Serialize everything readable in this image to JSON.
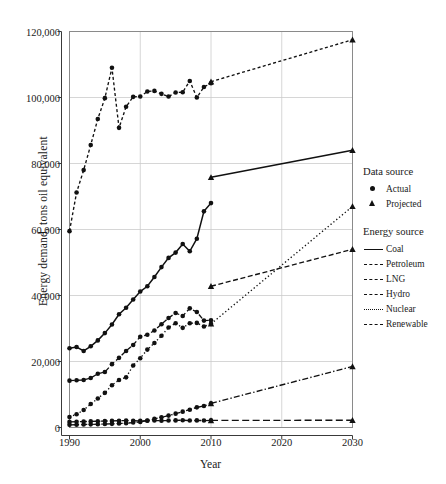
{
  "chart_data": {
    "type": "line",
    "title": "",
    "xlabel": "Year",
    "ylabel": "Energy demand, tons oil equivalent",
    "xlim": [
      1990,
      2030
    ],
    "ylim": [
      0,
      120000
    ],
    "xticks": [
      1990,
      2000,
      2010,
      2020,
      2030
    ],
    "xticklabels": [
      "1990",
      "2000",
      "2010",
      "2020",
      "2030"
    ],
    "yticks": [
      0,
      20000,
      40000,
      60000,
      80000,
      100000,
      120000
    ],
    "yticklabels": [
      "0",
      "20,000",
      "40,000",
      "60,000",
      "80,000",
      "100,000",
      "120,000"
    ],
    "grid": true,
    "legend_position": "right",
    "marker_actual": "circle",
    "marker_projected": "triangle",
    "line_color": "#111111",
    "grid_color": "#cccccc",
    "series": [
      {
        "name": "Coal",
        "style": "solid",
        "actual": {
          "x": [
            1990,
            1991,
            1992,
            1993,
            1994,
            1995,
            1996,
            1997,
            1998,
            1999,
            2000,
            2001,
            2002,
            2003,
            2004,
            2005,
            2006,
            2007,
            2008,
            2009,
            2010
          ],
          "y": [
            24000,
            24400,
            23200,
            24600,
            26400,
            28600,
            31200,
            34300,
            36300,
            38800,
            41200,
            42800,
            45600,
            48600,
            51400,
            53000,
            55600,
            53400,
            57200,
            65500,
            68000
          ]
        },
        "projected": {
          "x": [
            2010,
            2030
          ],
          "y": [
            75800,
            84000
          ]
        }
      },
      {
        "name": "Petroleum",
        "style": "dashed",
        "actual": {
          "x": [
            1990,
            1991,
            1992,
            1993,
            1994,
            1995,
            1996,
            1997,
            1998,
            1999,
            2000,
            2001,
            2002,
            2003,
            2004,
            2005,
            2006,
            2007,
            2008,
            2009,
            2010
          ],
          "y": [
            59500,
            71200,
            78000,
            85600,
            93500,
            99800,
            109000,
            90800,
            97200,
            100200,
            100300,
            101800,
            102000,
            101100,
            100300,
            101500,
            101600,
            105000,
            100000,
            103200,
            104300
          ]
        },
        "projected": {
          "x": [
            2010,
            2030
          ],
          "y": [
            104800,
            117500
          ]
        }
      },
      {
        "name": "LNG",
        "style": "dashed-medium",
        "actual": {
          "x": [
            1990,
            1991,
            1992,
            1993,
            1994,
            1995,
            1996,
            1997,
            1998,
            1999,
            2000,
            2001,
            2002,
            2003,
            2004,
            2005,
            2006,
            2007,
            2008,
            2009,
            2010
          ],
          "y": [
            14200,
            14300,
            14400,
            15000,
            16300,
            16800,
            19200,
            21100,
            23200,
            25000,
            27500,
            28100,
            29400,
            31300,
            33200,
            34700,
            33800,
            36100,
            35000,
            32400,
            32500
          ]
        },
        "projected": {
          "x": [
            2010,
            2030
          ],
          "y": [
            42800,
            54000
          ]
        }
      },
      {
        "name": "Hydro",
        "style": "dashed-long",
        "actual": {
          "x": [
            1990,
            1991,
            1992,
            1993,
            1994,
            1995,
            1996,
            1997,
            1998,
            1999,
            2000,
            2001,
            2002,
            2003,
            2004,
            2005,
            2006,
            2007,
            2008,
            2009,
            2010
          ],
          "y": [
            1700,
            1750,
            1800,
            1850,
            1900,
            1950,
            2000,
            2050,
            2100,
            2050,
            2000,
            2050,
            2100,
            2050,
            2100,
            2150,
            2200,
            2100,
            2150,
            2100,
            2150
          ]
        },
        "projected": {
          "x": [
            2010,
            2030
          ],
          "y": [
            2150,
            2200
          ]
        }
      },
      {
        "name": "Nuclear",
        "style": "dotted",
        "actual": {
          "x": [
            1990,
            1991,
            1992,
            1993,
            1994,
            1995,
            1996,
            1997,
            1998,
            1999,
            2000,
            2001,
            2002,
            2003,
            2004,
            2005,
            2006,
            2007,
            2008,
            2009,
            2010
          ],
          "y": [
            3200,
            4000,
            5300,
            7100,
            8800,
            10500,
            12800,
            14400,
            15200,
            18800,
            21000,
            23600,
            25600,
            27800,
            30300,
            31600,
            30200,
            31600,
            31700,
            30600,
            31400
          ]
        },
        "projected": {
          "x": [
            2010,
            2030
          ],
          "y": [
            31400,
            67000
          ]
        }
      },
      {
        "name": "Renewable",
        "style": "dash-dot",
        "actual": {
          "x": [
            1990,
            1991,
            1992,
            1993,
            1994,
            1995,
            1996,
            1997,
            1998,
            1999,
            2000,
            2001,
            2002,
            2003,
            2004,
            2005,
            2006,
            2007,
            2008,
            2009,
            2010
          ],
          "y": [
            800,
            850,
            900,
            950,
            1000,
            1050,
            1100,
            1200,
            1300,
            1500,
            1700,
            2100,
            2600,
            3100,
            3600,
            4200,
            4800,
            5400,
            6100,
            6500,
            7300
          ]
        },
        "projected": {
          "x": [
            2010,
            2030
          ],
          "y": [
            7300,
            18500
          ]
        }
      }
    ]
  },
  "legend": {
    "data_source_title": "Data source",
    "data_source_items": [
      {
        "label": "Actual",
        "marker": "circle-marker-icon"
      },
      {
        "label": "Projected",
        "marker": "triangle-marker-icon"
      }
    ],
    "energy_source_title": "Energy source",
    "energy_source_items": [
      {
        "label": "Coal",
        "style": "solid"
      },
      {
        "label": "Petroleum",
        "style": "dashed"
      },
      {
        "label": "LNG",
        "style": "dashed-medium"
      },
      {
        "label": "Hydro",
        "style": "dashed-long"
      },
      {
        "label": "Nuclear",
        "style": "dotted"
      },
      {
        "label": "Renewable",
        "style": "dash-dot"
      }
    ]
  }
}
